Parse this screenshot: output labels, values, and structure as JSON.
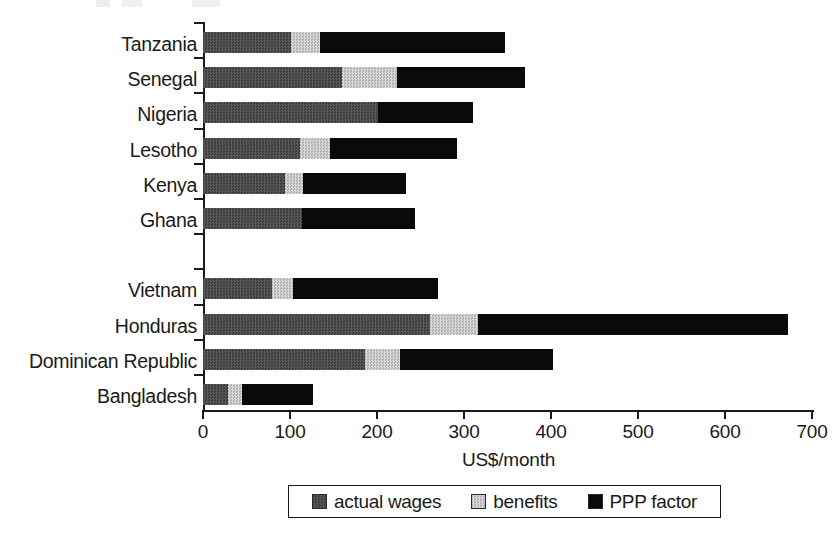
{
  "chart_data": {
    "type": "bar",
    "orientation": "horizontal",
    "stacked": true,
    "title": "",
    "xlabel": "US$/month",
    "ylabel": "",
    "xlim": [
      0,
      700
    ],
    "xticks": [
      0,
      100,
      200,
      300,
      400,
      500,
      600,
      700
    ],
    "xtick_labels": [
      "0",
      "100",
      "200",
      "300",
      "400",
      "500",
      "600",
      "700"
    ],
    "grid": false,
    "legend_position": "bottom",
    "categories": [
      "Tanzania",
      "Senegal",
      "Nigeria",
      "Lesotho",
      "Kenya",
      "Ghana",
      "",
      "Vietnam",
      "Honduras",
      "Dominican Republic",
      "Bangladesh"
    ],
    "series": [
      {
        "name": "actual wages",
        "color": "#4b4b4b",
        "values": [
          101,
          160,
          201,
          112,
          94,
          114,
          null,
          79,
          261,
          186,
          29
        ]
      },
      {
        "name": "benefits",
        "color": "#c6c6c6",
        "values": [
          33,
          63,
          0,
          34,
          21,
          0,
          null,
          24,
          55,
          40,
          16
        ]
      },
      {
        "name": "PPP factor",
        "color": "#0a0a0a",
        "values": [
          213,
          147,
          109,
          146,
          118,
          130,
          null,
          167,
          357,
          176,
          81
        ]
      }
    ],
    "totals": [
      347,
      370,
      310,
      292,
      233,
      244,
      null,
      270,
      673,
      402,
      126
    ]
  },
  "legend": {
    "items": [
      {
        "label": "actual wages",
        "swatch": "wages-swatch"
      },
      {
        "label": "benefits",
        "swatch": "benefits-swatch"
      },
      {
        "label": "PPP factor",
        "swatch": "ppp-swatch"
      }
    ]
  },
  "axis": {
    "x_title": "US$/month"
  }
}
